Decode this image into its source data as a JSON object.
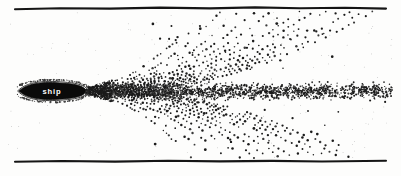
{
  "figure": {
    "name": "ship-wake-diagram",
    "background_color": "#fdfdfc",
    "ink_color": "#151515",
    "width": 401,
    "height": 176
  },
  "ship": {
    "label": "ship",
    "label_color": "#ffffff",
    "hull_color": "#0a0a0a",
    "bow_x": 19,
    "stern_x": 86,
    "center_y": 91,
    "half_height": 8.5
  },
  "walls": {
    "top": {
      "name": "top-channel-wall",
      "x_start": 15,
      "x_end": 386,
      "y": 8
    },
    "bottom": {
      "name": "bottom-channel-wall",
      "x_start": 15,
      "x_end": 386,
      "y": 161
    }
  },
  "chart_data": {
    "type": "scatter",
    "title": "",
    "xlabel": "",
    "ylabel": "",
    "xlim": [
      0,
      401
    ],
    "ylim": [
      0,
      176
    ],
    "grid": false,
    "legend": null,
    "annotations": [
      {
        "text": "ship",
        "x": 52,
        "y": 91
      }
    ],
    "series": [
      {
        "name": "upper-wake-arcs",
        "style": "dotted-arc-family",
        "color": "#1b1b1b",
        "origin": [
          88,
          88
        ],
        "arc_count": 13,
        "arc_spacing": 11.5,
        "sweep": "up-right",
        "dot_radius": 0.95
      },
      {
        "name": "lower-wake-arcs",
        "style": "dotted-arc-family",
        "color": "#1b1b1b",
        "origin": [
          88,
          94
        ],
        "arc_count": 13,
        "arc_spacing": 11.5,
        "sweep": "down-right",
        "dot_radius": 0.95
      },
      {
        "name": "turbulent-centerline-band",
        "style": "dense-dot-band",
        "color": "#2a2a2a",
        "x_range": [
          95,
          392
        ],
        "y_range": [
          82,
          101
        ],
        "dot_radius": 0.8
      },
      {
        "name": "scattered-spray",
        "style": "sparse-dots",
        "color": "#1b1b1b",
        "x_range": [
          150,
          340
        ],
        "y_range": [
          20,
          150
        ],
        "dot_radius": 1.1
      },
      {
        "name": "hull-boundary-dots",
        "style": "outline-dots",
        "color": "#2a2a2a",
        "dot_radius": 0.7
      }
    ]
  }
}
